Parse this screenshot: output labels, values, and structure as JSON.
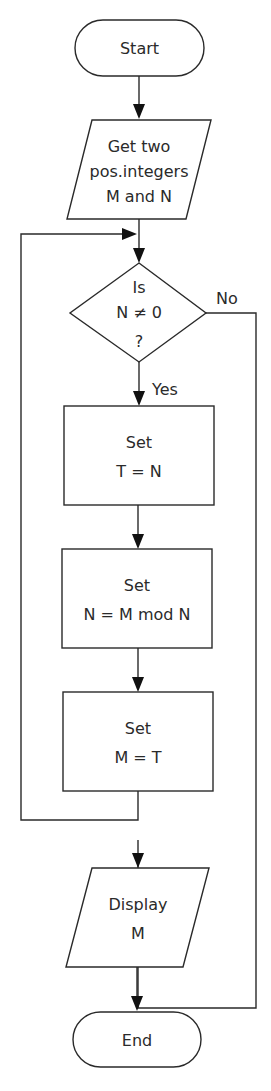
{
  "diagram": {
    "type": "flowchart",
    "nodes": [
      {
        "id": "start",
        "shape": "terminator",
        "lines": [
          "Start"
        ]
      },
      {
        "id": "input",
        "shape": "parallelogram",
        "lines": [
          "Get two",
          "pos.integers",
          "M and N"
        ]
      },
      {
        "id": "decision",
        "shape": "diamond",
        "lines": [
          "Is",
          "N ≠ 0",
          "?"
        ]
      },
      {
        "id": "set_t",
        "shape": "rectangle",
        "lines": [
          "Set",
          "T = N"
        ]
      },
      {
        "id": "set_n",
        "shape": "rectangle",
        "lines": [
          "Set",
          "N = M mod N"
        ]
      },
      {
        "id": "set_m",
        "shape": "rectangle",
        "lines": [
          "Set",
          "M = T"
        ]
      },
      {
        "id": "output",
        "shape": "parallelogram",
        "lines": [
          "Display",
          "M"
        ]
      },
      {
        "id": "end",
        "shape": "terminator",
        "lines": [
          "End"
        ]
      }
    ],
    "edges": [
      {
        "from": "start",
        "to": "input",
        "label": ""
      },
      {
        "from": "input",
        "to": "decision",
        "label": ""
      },
      {
        "from": "decision",
        "to": "set_t",
        "label": "Yes"
      },
      {
        "from": "decision",
        "to": "output",
        "label": "No"
      },
      {
        "from": "set_t",
        "to": "set_n",
        "label": ""
      },
      {
        "from": "set_n",
        "to": "set_m",
        "label": ""
      },
      {
        "from": "set_m",
        "to": "decision",
        "label": "loop"
      },
      {
        "from": "output",
        "to": "end",
        "label": ""
      }
    ],
    "edge_labels": {
      "yes": "Yes",
      "no": "No"
    },
    "colors": {
      "stroke": "#2a2a2a",
      "fill": "#ffffff",
      "arrowhead": "#111111"
    }
  }
}
